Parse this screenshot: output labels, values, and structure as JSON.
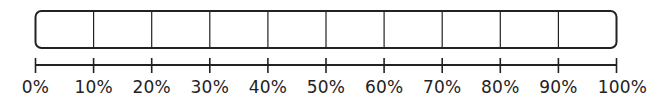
{
  "diagram": {
    "type": "percentage-bar",
    "segments": 10,
    "stroke_color": "#222222",
    "axis_labels": [
      "0%",
      "10%",
      "20%",
      "30%",
      "40%",
      "50%",
      "60%",
      "70%",
      "80%",
      "90%",
      "100%"
    ]
  }
}
